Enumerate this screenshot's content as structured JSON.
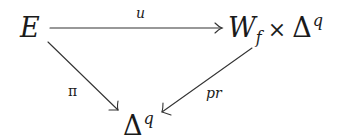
{
  "diagram": {
    "type": "commutative-diagram",
    "nodes": {
      "top_left": {
        "base": "E"
      },
      "top_right": {
        "base": "W",
        "subscript": "f",
        "operator": "×",
        "base2": "Δ",
        "superscript": "q"
      },
      "bottom": {
        "base": "Δ",
        "superscript": "q"
      }
    },
    "arrows": {
      "top": {
        "from": "E",
        "to": "W_f × Δ^q",
        "label": "u"
      },
      "left": {
        "from": "E",
        "to": "Δ^q",
        "label": "π"
      },
      "right": {
        "from": "W_f × Δ^q",
        "to": "Δ^q",
        "label": "pr"
      }
    },
    "colors": {
      "ink": "#1a1a1a",
      "background": "#ffffff"
    }
  }
}
